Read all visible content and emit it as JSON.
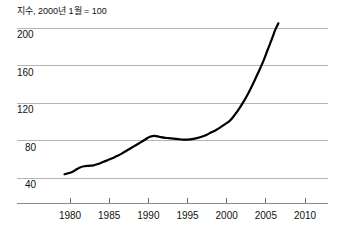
{
  "chart_data": {
    "type": "line",
    "title": "지수, 2000년 1월 = 100",
    "xlabel": "",
    "ylabel": "",
    "xlim": [
      1978.0,
      2012.0
    ],
    "ylim": [
      20,
      220
    ],
    "grid": true,
    "legend": false,
    "y_ticks": [
      200,
      160,
      120,
      80,
      40
    ],
    "x_ticks": [
      1980,
      1985,
      1990,
      1995,
      2000,
      2005,
      2010
    ],
    "line_color": "#000000",
    "grid_color": "#b5b5b5",
    "axis_color": "#8c8c8c",
    "series": [
      {
        "name": "지수",
        "x": [
          1979.3,
          1980.0,
          1980.6,
          1981.2,
          1981.8,
          1982.4,
          1983.0,
          1983.6,
          1984.2,
          1984.8,
          1985.4,
          1986.0,
          1986.6,
          1987.2,
          1987.8,
          1988.4,
          1989.0,
          1989.6,
          1990.2,
          1990.8,
          1991.4,
          1992.0,
          1992.6,
          1993.2,
          1993.8,
          1994.4,
          1995.0,
          1995.6,
          1996.2,
          1996.8,
          1997.4,
          1998.0,
          1998.6,
          1999.2,
          1999.8,
          2000.4,
          2001.0,
          2001.6,
          2002.2,
          2002.8,
          2003.4,
          2004.0,
          2004.6,
          2005.2,
          2005.8,
          2006.2,
          2006.6
        ],
        "y": [
          44.0,
          45.5,
          48.0,
          51.0,
          52.5,
          53.0,
          53.5,
          55.0,
          57.0,
          59.0,
          61.0,
          63.5,
          66.0,
          69.0,
          72.0,
          75.0,
          78.0,
          81.0,
          84.0,
          85.0,
          84.0,
          83.0,
          82.5,
          82.0,
          81.5,
          81.0,
          81.0,
          81.5,
          82.5,
          84.0,
          86.0,
          88.5,
          91.0,
          94.0,
          97.5,
          101.0,
          107.0,
          114.0,
          122.0,
          131.0,
          141.0,
          152.0,
          163.0,
          176.0,
          189.0,
          198.0,
          205.0
        ]
      }
    ]
  }
}
